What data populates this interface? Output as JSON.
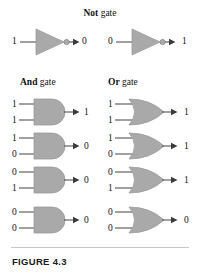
{
  "figure": {
    "caption": "FIGURE 4.3",
    "accent_gate_fill": "#a9a9a9",
    "accent_gate_stroke": "#8f8f8f",
    "wire_color": "#555555",
    "text_color": "#111111",
    "rule_color": "#c9c9c9",
    "background": "#ffffff"
  },
  "headings": {
    "not": {
      "bold": "Not",
      "rest": " gate"
    },
    "and": {
      "bold": "And",
      "rest": " gate"
    },
    "or": {
      "bold": "Or",
      "rest": " gate"
    }
  },
  "not_gate": {
    "label": "Not gate",
    "cases": [
      {
        "input": "1",
        "output": "0"
      },
      {
        "input": "0",
        "output": "1"
      }
    ]
  },
  "and_gate": {
    "label": "And gate",
    "rows": [
      {
        "input_top": "1",
        "input_bottom": "1",
        "output": "1"
      },
      {
        "input_top": "1",
        "input_bottom": "0",
        "output": "0"
      },
      {
        "input_top": "0",
        "input_bottom": "1",
        "output": "0"
      },
      {
        "input_top": "0",
        "input_bottom": "0",
        "output": "0"
      }
    ]
  },
  "or_gate": {
    "label": "Or gate",
    "rows": [
      {
        "input_top": "1",
        "input_bottom": "1",
        "output": "1"
      },
      {
        "input_top": "1",
        "input_bottom": "0",
        "output": "1"
      },
      {
        "input_top": "0",
        "input_bottom": "1",
        "output": "1"
      },
      {
        "input_top": "0",
        "input_bottom": "0",
        "output": "0"
      }
    ]
  }
}
